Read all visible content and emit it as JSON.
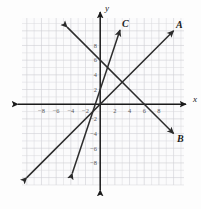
{
  "chart_data": {
    "type": "line",
    "title": "",
    "xlabel": "x",
    "ylabel": "y",
    "grid": true,
    "legend_position": "inline-endpoint-labels",
    "xlim": [
      -11,
      11
    ],
    "ylim": [
      -11,
      11
    ],
    "xticks": [
      -8,
      -6,
      -4,
      -2,
      2,
      4,
      6,
      8
    ],
    "yticks": [
      8,
      6,
      4,
      2,
      -2,
      -4,
      -6,
      -8
    ],
    "xtick_labels": [
      "-8",
      "-6",
      "-4",
      "-2",
      "2",
      "4",
      "6",
      "8"
    ],
    "ytick_labels": [
      "8",
      "6",
      "4",
      "2",
      "-2",
      "-4",
      "-6",
      "-8"
    ],
    "grid_step": 1,
    "tick_step": 2,
    "series": [
      {
        "name": "A",
        "label": "A",
        "slope": 1,
        "intercept": 0,
        "x": [
          -10,
          10
        ],
        "y": [
          -10,
          10
        ],
        "arrows": "both",
        "label_position": "upper-right"
      },
      {
        "name": "B",
        "label": "B",
        "slope": -1,
        "intercept": 6,
        "x": [
          -4.5,
          10
        ],
        "y": [
          10.5,
          -4
        ],
        "arrows": "both",
        "label_position": "lower-right"
      },
      {
        "name": "C",
        "label": "C",
        "slope": 3,
        "intercept": 2,
        "x": [
          -3.8,
          2.7
        ],
        "y": [
          -9.4,
          10.1
        ],
        "arrows": "both",
        "label_position": "top"
      }
    ]
  },
  "axes": {
    "x_axis_label": "x",
    "y_axis_label": "y",
    "x_arrow_left": true,
    "x_arrow_right": true,
    "y_arrow_up": true,
    "y_arrow_down": true
  },
  "labels": {
    "line_a": "A",
    "line_b": "B",
    "line_c": "C"
  },
  "colors": {
    "background": "#fdfdfd",
    "grid_minor": "#d9d9dd",
    "grid_major": "#cfcfd4",
    "axis": "#1a1a1a",
    "line": "#2b2b2b",
    "tick_text": "#555558"
  }
}
